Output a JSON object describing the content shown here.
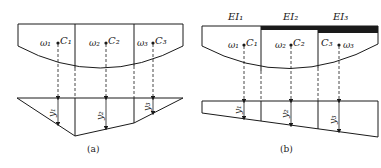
{
  "panel_a": {
    "caption": "(a)",
    "areas": [
      {
        "omega": "ω₁",
        "centroid": "C₁",
        "ordinate": "y₁"
      },
      {
        "omega": "ω₂",
        "centroid": "C₂",
        "ordinate": "y₂"
      },
      {
        "omega": "ω₃",
        "centroid": "C₃",
        "ordinate": "y₃"
      }
    ]
  },
  "panel_b": {
    "caption": "(b)",
    "stiffness": [
      "EI₁",
      "EI₂",
      "EI₃"
    ],
    "areas": [
      {
        "omega": "ω₁",
        "centroid": "C₁",
        "ordinate": "y₁"
      },
      {
        "omega": "ω₂",
        "centroid": "C₂",
        "ordinate": "y₂"
      },
      {
        "omega": "ω₃",
        "centroid": "C₃",
        "ordinate": "y₃"
      }
    ]
  }
}
